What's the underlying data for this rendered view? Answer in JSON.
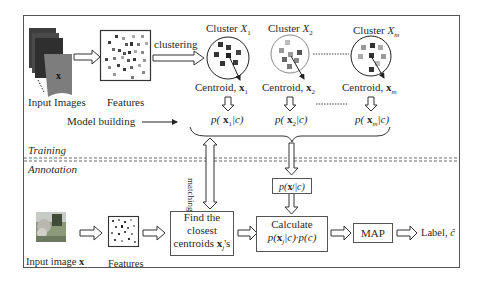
{
  "diagram": {
    "sections": {
      "training_label": "Training",
      "annotation_label": "Annotation"
    },
    "training": {
      "input_images_label": "Input Images",
      "input_images_symbol": "x",
      "features_label": "Features",
      "clustering_label": "clustering",
      "clusters": [
        {
          "title_prefix": "Cluster ",
          "title_var": "X",
          "title_sub": "1",
          "centroid_prefix": "Centroid, ",
          "centroid_var": "x",
          "centroid_sub": "1",
          "prob": "p( x1|c)",
          "prob_pre": "p(",
          "prob_var": " x",
          "prob_sub": "1",
          "prob_post": "|c)"
        },
        {
          "title_prefix": "Cluster ",
          "title_var": "X",
          "title_sub": "2",
          "centroid_prefix": "Centroid, ",
          "centroid_var": "x",
          "centroid_sub": "2",
          "prob": "p( x2|c)",
          "prob_pre": "p(",
          "prob_var": " x",
          "prob_sub": "2",
          "prob_post": "|c)"
        },
        {
          "title_prefix": "Cluster ",
          "title_var": "X",
          "title_sub": "m",
          "centroid_prefix": "Centroid, ",
          "centroid_var": "x",
          "centroid_sub": "m",
          "prob": "p( xm|c)",
          "prob_pre": "p(",
          "prob_var": " x",
          "prob_sub": "m",
          "prob_post": "|c)"
        }
      ],
      "model_building_label": "Model building",
      "matching_label": "matching"
    },
    "annotation": {
      "input_image_label_prefix": "Input image ",
      "input_image_label_var": "x",
      "features_label": "Features",
      "find_box": {
        "line1": "Find the",
        "line2": "closest",
        "line3_prefix": "centroids ",
        "line3_var": "x",
        "line3_sub": "j",
        "line3_suffix": "'s"
      },
      "prob_box": {
        "pre": "p(",
        "var": " x",
        "sub": "j",
        "post": "|c)"
      },
      "calc_box": {
        "line1": "Calculate",
        "line2_pre": "p(",
        "line2_var": "x",
        "line2_sub": "j",
        "line2_post": "|c)·p(c)"
      },
      "map_box": "MAP",
      "output_label_prefix": "Label, ",
      "output_label_var": "ĉ"
    },
    "colors": {
      "frame": "#555555",
      "dark_square": "#3a3a3a",
      "mid_square": "#777777",
      "light_square": "#aaaaaa"
    }
  }
}
